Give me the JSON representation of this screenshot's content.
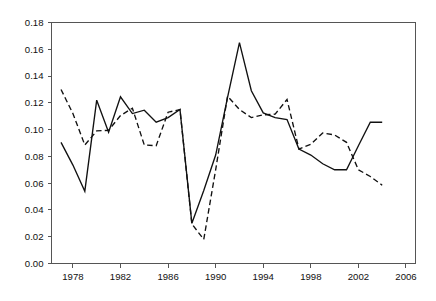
{
  "chart_data": {
    "type": "line",
    "title": "",
    "subtitle": "",
    "xlabel": "",
    "ylabel": "",
    "xlim": [
      1976.2,
      2006.8
    ],
    "ylim": [
      0.0,
      0.18
    ],
    "grid": false,
    "legend": "none",
    "x_ticks": [
      1978,
      1982,
      1986,
      1990,
      1994,
      1998,
      2002,
      2006
    ],
    "x_tick_labels": [
      "1978",
      "1982",
      "1986",
      "1990",
      "1994",
      "1998",
      "2002",
      "2006"
    ],
    "y_ticks": [
      0.0,
      0.02,
      0.04,
      0.06,
      0.08,
      0.1,
      0.12,
      0.14,
      0.16,
      0.18
    ],
    "y_tick_labels": [
      "0.00",
      "0.02",
      "0.04",
      "0.06",
      "0.08",
      "0.10",
      "0.12",
      "0.14",
      "0.16",
      "0.18"
    ],
    "x": [
      1977,
      1978,
      1979,
      1980,
      1981,
      1982,
      1983,
      1984,
      1985,
      1986,
      1987,
      1988,
      1989,
      1990,
      1991,
      1992,
      1993,
      1994,
      1995,
      1996,
      1997,
      1998,
      1999,
      2000,
      2001,
      2002,
      2003,
      2004
    ],
    "series": [
      {
        "name": "series-solid",
        "style": "solid",
        "color": "#111111",
        "values": [
          0.0905,
          0.0735,
          0.054,
          0.122,
          0.098,
          0.1245,
          0.112,
          0.1145,
          0.1055,
          0.109,
          0.115,
          0.03,
          0.0545,
          0.081,
          0.124,
          0.165,
          0.129,
          0.1125,
          0.109,
          0.1075,
          0.0855,
          0.081,
          0.0745,
          0.07,
          0.07,
          0.088,
          0.1055,
          0.1055
        ]
      },
      {
        "name": "series-dashed",
        "style": "dashed",
        "color": "#111111",
        "values": [
          0.13,
          0.112,
          0.0885,
          0.099,
          0.0995,
          0.1105,
          0.116,
          0.0885,
          0.088,
          0.113,
          0.115,
          0.0295,
          0.018,
          0.07,
          0.125,
          0.115,
          0.109,
          0.111,
          0.1115,
          0.1225,
          0.0855,
          0.089,
          0.0975,
          0.096,
          0.0905,
          0.07,
          0.065,
          0.0585
        ]
      }
    ],
    "annotations": []
  }
}
